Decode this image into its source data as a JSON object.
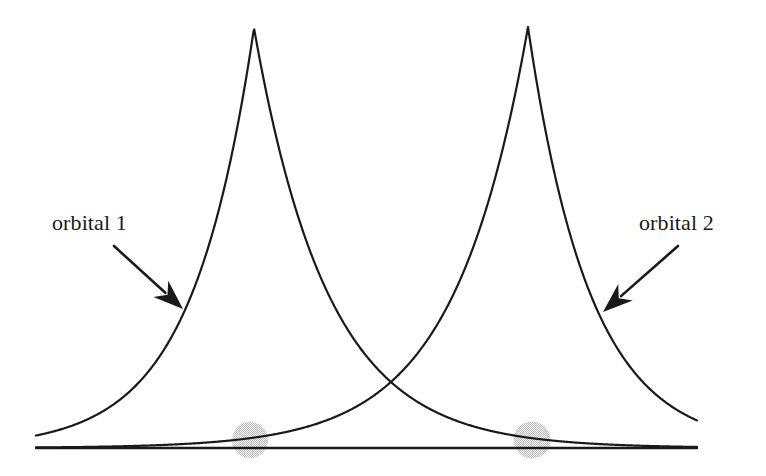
{
  "figure": {
    "kind": "orbital-overlap-diagram",
    "width": 766,
    "height": 476,
    "background_color": "#ffffff",
    "line_color": "#1a1a1a",
    "nucleus_color": "#d9d9d9"
  },
  "labels": {
    "orbital_1": "orbital 1",
    "orbital_2": "orbital 2"
  },
  "chart_data": {
    "type": "line",
    "title": "",
    "xlabel": "",
    "ylabel": "",
    "grid": false,
    "legend": "none",
    "annotations": [
      {
        "name": "orbital-1-label",
        "text": "orbital 1",
        "x": 52,
        "y": 231,
        "arrow_from": [
          114,
          246
        ],
        "arrow_to": [
          183,
          309
        ]
      },
      {
        "name": "orbital-2-label",
        "text": "orbital 2",
        "x": 639,
        "y": 231,
        "arrow_from": [
          678,
          246
        ],
        "arrow_to": [
          603,
          312
        ]
      }
    ],
    "axis_line": {
      "name": "baseline",
      "x_start": 36,
      "x_end": 697,
      "y": 448
    },
    "nuclei": [
      {
        "name": "nucleus-1",
        "cx": 250,
        "cy": 440,
        "r": 18,
        "color": "#d9d9d9"
      },
      {
        "name": "nucleus-2",
        "cx": 532,
        "cy": 440,
        "r": 18.5,
        "color": "#d9d9d9"
      }
    ],
    "crossing_point": {
      "x": 393,
      "y": 412
    },
    "series": [
      {
        "name": "orbital 1",
        "form": "exponential-cusp",
        "peak_x": 254,
        "peak_y": 28,
        "baseline_y": 448,
        "x_start": 36,
        "x_end": 697,
        "decay_left": 62,
        "decay_right": 74
      },
      {
        "name": "orbital 2",
        "form": "exponential-cusp",
        "peak_x": 528,
        "peak_y": 27,
        "baseline_y": 448,
        "x_start": 36,
        "x_end": 697,
        "decay_left": 74,
        "decay_right": 62
      }
    ]
  }
}
